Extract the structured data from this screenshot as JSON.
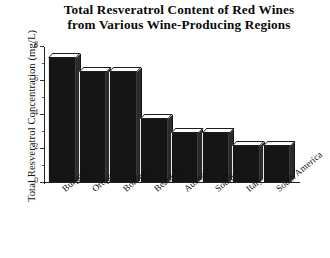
{
  "chart_data": {
    "type": "bar",
    "title": "Total Resveratrol Content of Red Wines from Various Wine-Producing Regions",
    "title_line1": "Total Resveratrol Content of Red Wines",
    "title_line2": "from Various Wine-Producing Regions",
    "xlabel": "",
    "ylabel": "Total Resveratrol Concentration (mg/L)",
    "categories": [
      "Burgundy",
      "Oregon",
      "Bordeaux",
      "Beaujolais",
      "Australia",
      "South Africa",
      "Italy",
      "South America"
    ],
    "values": [
      7.3,
      6.5,
      6.5,
      3.7,
      2.9,
      2.9,
      2.1,
      2.1
    ],
    "ylim": [
      0,
      8
    ],
    "ytick_labels": [
      "0",
      "2",
      "4",
      "6",
      "8"
    ],
    "ytick_values": [
      0,
      2,
      4,
      6,
      8
    ],
    "minor_tick_values": [
      1,
      3,
      5,
      7
    ],
    "grid": false,
    "legend": false,
    "bar_color": "#151515",
    "bar_top_color": "#fbfbfb",
    "bar_side_color": "#2b2b2b",
    "axis_color": "#222222",
    "background": "#ffffff"
  }
}
